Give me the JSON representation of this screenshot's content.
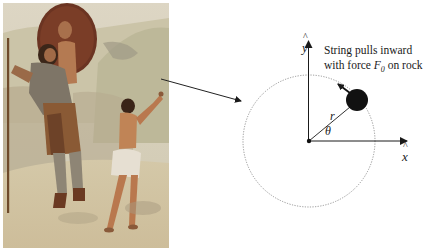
{
  "figure": {
    "painting": {
      "description": "Painting of David confronting Goliath with sling raised; shield bearer behind",
      "colors": {
        "sky": "#d9d2bf",
        "hill": "#c7c2a6",
        "ground": "#d6c8a8",
        "shield": "#6b3422",
        "skin": "#b9784e",
        "armor": "#7d7466",
        "tunic": "#e6dfd2",
        "hair": "#3a2418"
      }
    },
    "pointer_arrow": {
      "from": [
        161,
        79
      ],
      "to": [
        242,
        101
      ],
      "color": "#222222"
    },
    "diagram": {
      "origin": [
        309,
        141
      ],
      "circle": {
        "cx": 309,
        "cy": 141,
        "r": 66,
        "style": "dotted",
        "color": "#888888"
      },
      "x_axis": {
        "label": "x",
        "hat": true,
        "end": [
          407,
          141
        ]
      },
      "y_axis": {
        "label": "y",
        "hat": true,
        "end": [
          308,
          41
        ]
      },
      "rock": {
        "cx": 357,
        "cy": 100,
        "r": 11,
        "color": "#111111"
      },
      "radius_label": "r",
      "angle_label": "θ",
      "force_arrow": {
        "from": [
          350,
          93
        ],
        "to": [
          337,
          83
        ]
      },
      "caption_line1": "String pulls inward",
      "caption_line2_prefix": "with force ",
      "caption_force_symbol": "F",
      "caption_force_subscript": "0",
      "caption_line2_suffix": " on rock"
    }
  }
}
